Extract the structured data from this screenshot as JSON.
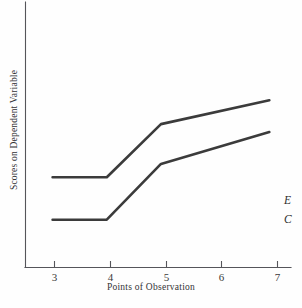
{
  "chart_data": {
    "type": "line",
    "title": "",
    "xlabel": "Points of Observation",
    "ylabel": "Scores on Dependent Variable",
    "x": [
      3,
      4,
      5,
      6,
      7
    ],
    "xticklabels": [
      "3",
      "4",
      "5",
      "6",
      "7"
    ],
    "xlim": [
      2.5,
      7.4
    ],
    "ylim": [
      0,
      100
    ],
    "yticklabels": [],
    "grid": false,
    "legend_position": "right-end-of-line",
    "series": [
      {
        "name": "E",
        "label": "E",
        "color": "#3b3b3b",
        "x": [
          3,
          4,
          5,
          7
        ],
        "values": [
          34,
          34,
          54,
          63
        ]
      },
      {
        "name": "C",
        "label": "C",
        "color": "#3b3b3b",
        "x": [
          3,
          4,
          5,
          7
        ],
        "values": [
          18,
          18,
          39,
          51
        ]
      }
    ],
    "annotations": []
  },
  "axes": {
    "x_title": "Points of Observation",
    "y_title": "Scores on Dependent Variable",
    "tick_labels_x": [
      "3",
      "4",
      "5",
      "6",
      "7"
    ]
  },
  "series_labels": {
    "experimental": "E",
    "control": "C"
  },
  "colors": {
    "line": "#3b3b3b",
    "axis": "#55555a",
    "background": "#fefefe",
    "text": "#333336"
  }
}
